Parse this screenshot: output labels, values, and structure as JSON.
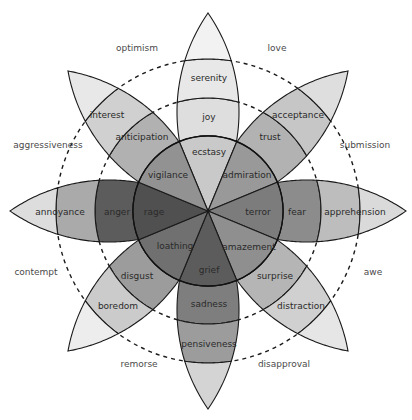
{
  "diagram": {
    "center": [
      208,
      211
    ],
    "petal_length": 198,
    "petal_sagitta": 31,
    "ring_radii": [
      75,
      113,
      152
    ],
    "dashed_ring_radii": [
      113,
      152
    ],
    "label_radii": [
      55,
      95,
      133
    ],
    "petals": [
      {
        "id": "joy",
        "angle": -90,
        "bands": [
          {
            "label": "ecstasy",
            "color": "#c9c9c9"
          },
          {
            "label": "joy",
            "color": "#dedede"
          },
          {
            "label": "serenity",
            "color": "#e8e8e8"
          },
          {
            "label": "",
            "color": "#f2f2f2"
          }
        ]
      },
      {
        "id": "trust",
        "angle": -45,
        "bands": [
          {
            "label": "admiration",
            "color": "#999999"
          },
          {
            "label": "trust",
            "color": "#b2b2b2"
          },
          {
            "label": "acceptance",
            "color": "#c6c6c6"
          },
          {
            "label": "",
            "color": "#dedede"
          }
        ]
      },
      {
        "id": "fear",
        "angle": 0,
        "bands": [
          {
            "label": "terror",
            "color": "#7c7c7c"
          },
          {
            "label": "fear",
            "color": "#8c8c8c"
          },
          {
            "label": "apprehension",
            "color": "#bdbdbd"
          },
          {
            "label": "",
            "color": "#dadada"
          }
        ]
      },
      {
        "id": "surprise",
        "angle": 45,
        "bands": [
          {
            "label": "amazement",
            "color": "#8f8f8f"
          },
          {
            "label": "surprise",
            "color": "#b5b5b5"
          },
          {
            "label": "distraction",
            "color": "#d0d0d0"
          },
          {
            "label": "",
            "color": "#e6e6e6"
          }
        ]
      },
      {
        "id": "sadness",
        "angle": 90,
        "bands": [
          {
            "label": "grief",
            "color": "#5c5c5c"
          },
          {
            "label": "sadness",
            "color": "#7e7e7e"
          },
          {
            "label": "pensiveness",
            "color": "#9c9c9c"
          },
          {
            "label": "",
            "color": "#d4d4d4"
          }
        ]
      },
      {
        "id": "disgust",
        "angle": 135,
        "bands": [
          {
            "label": "loathing",
            "color": "#707070"
          },
          {
            "label": "disgust",
            "color": "#9c9c9c"
          },
          {
            "label": "boredom",
            "color": "#cbcbcb"
          },
          {
            "label": "",
            "color": "#ededed"
          }
        ]
      },
      {
        "id": "anger",
        "angle": 180,
        "bands": [
          {
            "label": "rage",
            "color": "#505050"
          },
          {
            "label": "anger",
            "color": "#5c5c5c"
          },
          {
            "label": "annoyance",
            "color": "#aaaaaa"
          },
          {
            "label": "",
            "color": "#dddddd"
          }
        ]
      },
      {
        "id": "anticipation",
        "angle": -135,
        "bands": [
          {
            "label": "vigilance",
            "color": "#929292"
          },
          {
            "label": "anticipation",
            "color": "#b1b1b1"
          },
          {
            "label": "interest",
            "color": "#d0d0d0"
          },
          {
            "label": "",
            "color": "#e8e8e8"
          }
        ]
      }
    ],
    "band_label_positions": {
      "ecstasy": [
        209,
        152
      ],
      "joy": [
        209,
        117
      ],
      "serenity": [
        209,
        78
      ],
      "admiration": [
        247,
        175
      ],
      "trust": [
        270,
        137
      ],
      "acceptance": [
        298,
        115
      ],
      "terror": [
        258,
        212
      ],
      "fear": [
        297,
        212
      ],
      "apprehension": [
        355,
        212
      ],
      "amazement": [
        249,
        247
      ],
      "surprise": [
        275,
        276
      ],
      "distraction": [
        301,
        306
      ],
      "grief": [
        209,
        270
      ],
      "sadness": [
        209,
        304
      ],
      "pensiveness": [
        209,
        344
      ],
      "loathing": [
        175,
        246
      ],
      "disgust": [
        137,
        276
      ],
      "boredom": [
        118,
        306
      ],
      "rage": [
        154,
        212
      ],
      "anger": [
        117,
        212
      ],
      "annoyance": [
        60,
        212
      ],
      "vigilance": [
        168,
        175
      ],
      "anticipation": [
        142,
        137
      ],
      "interest": [
        107,
        115
      ]
    },
    "dyads": [
      {
        "label": "optimism",
        "pos": [
          137,
          51
        ]
      },
      {
        "label": "love",
        "pos": [
          277,
          51
        ]
      },
      {
        "label": "aggressiveness",
        "pos": [
          48,
          148
        ]
      },
      {
        "label": "submission",
        "pos": [
          365,
          148
        ]
      },
      {
        "label": "contempt",
        "pos": [
          36,
          275
        ]
      },
      {
        "label": "awe",
        "pos": [
          373,
          275
        ]
      },
      {
        "label": "remorse",
        "pos": [
          139,
          367
        ]
      },
      {
        "label": "disapproval",
        "pos": [
          284,
          367
        ]
      }
    ]
  }
}
